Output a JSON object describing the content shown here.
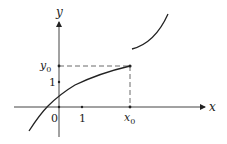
{
  "diagram": {
    "axes": {
      "x_label": "x",
      "y_label": "y"
    },
    "ticks": {
      "origin": "0",
      "x_one": "1",
      "y_one": "1",
      "x0_base": "x",
      "x0_sub": "0",
      "y0_base": "y",
      "y0_sub": "0"
    },
    "colors": {
      "stroke": "#222222",
      "background": "#ffffff"
    }
  }
}
